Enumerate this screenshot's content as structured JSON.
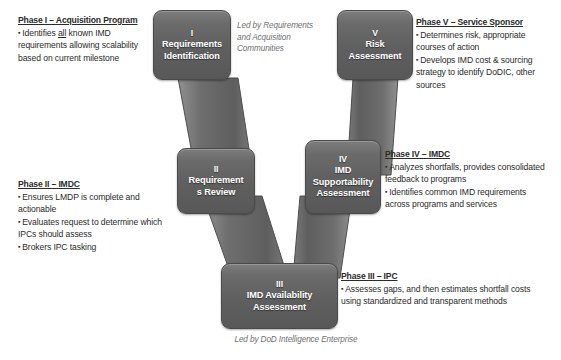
{
  "diagram": {
    "bottom_caption": "Led by DoD Intelligence Enterprise",
    "top_caption": "Led by Requirements and Acquisition Communities",
    "node_fill": "#626262",
    "node_text_color": "#ffffff",
    "caption_color": "#6f6f6f"
  },
  "nodes": [
    {
      "id": "node-1",
      "roman": "I",
      "lines": [
        "Requirements",
        "Identification"
      ]
    },
    {
      "id": "node-2",
      "roman": "II",
      "lines": [
        "Requirement",
        "s Review"
      ]
    },
    {
      "id": "node-3",
      "roman": "III",
      "lines": [
        "IMD Availability",
        "Assessment"
      ]
    },
    {
      "id": "node-4",
      "roman": "IV",
      "lines": [
        "IMD",
        "Supportability",
        "Assessment"
      ]
    },
    {
      "id": "node-5",
      "roman": "V",
      "lines": [
        "Risk",
        "Assessment"
      ]
    }
  ],
  "phases": {
    "phase1": {
      "title": "Phase I – Acquisition Program",
      "bullets": [
        "Identifies all known IMD requirements allowing scalability based on current milestone"
      ]
    },
    "phase2": {
      "title": "Phase II – IMDC",
      "bullets": [
        "Ensures LMDP is complete and actionable",
        "Evaluates request to determine which IPCs should assess",
        "Brokers IPC tasking"
      ]
    },
    "phase3": {
      "title": "Phase III – IPC",
      "bullets": [
        "Assesses gaps, and then estimates shortfall costs using standardized and transparent methods"
      ]
    },
    "phase4": {
      "title": "Phase IV – IMDC",
      "bullets": [
        "Analyzes shortfalls, provides consolidated feedback to programs",
        "Identifies common IMD requirements across programs and services"
      ]
    },
    "phase5": {
      "title": "Phase V – Service Sponsor",
      "bullets": [
        "Determines risk, appropriate courses of action",
        "Develops IMD cost & sourcing strategy to identify DoDIC, other sources"
      ]
    }
  }
}
